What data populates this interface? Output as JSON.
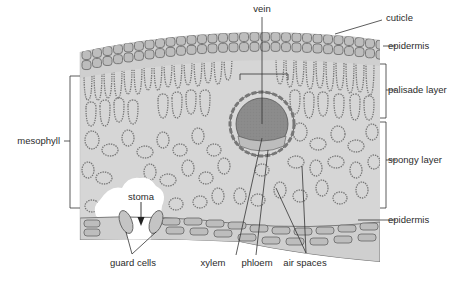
{
  "diagram": {
    "colors": {
      "background": "#ffffff",
      "tissue": "#d6d6d6",
      "cell_fill": "#c4c4c4",
      "cell_outline": "#6f6f6f",
      "vein_core": "#8c8c8c",
      "line": "#333333",
      "text": "#2b2b2b"
    },
    "labels": {
      "vein": "vein",
      "cuticle": "cuticle",
      "epidermis_upper": "epidermis",
      "palisade_layer": "palisade layer",
      "mesophyll": "mesophyll",
      "spongy_layer": "spongy layer",
      "epidermis_lower": "epidermis",
      "stoma": "stoma",
      "guard_cells": "guard cells",
      "xylem": "xylem",
      "phloem": "phloem",
      "air_spaces": "air spaces"
    }
  }
}
